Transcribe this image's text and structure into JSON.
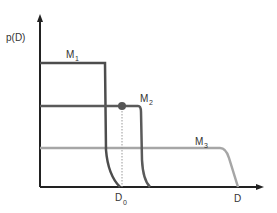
{
  "diagram": {
    "y_axis_label": "p(D)",
    "x_axis_label": "D",
    "x_marker_label": "D",
    "x_marker_sub": "0",
    "curves": [
      {
        "name": "M",
        "sub": "1",
        "color": "#4d4d4d",
        "plateau_y": 63,
        "plateau_end_x": 105,
        "end_x": 120
      },
      {
        "name": "M",
        "sub": "2",
        "color": "#5a5a5a",
        "plateau_y": 106,
        "plateau_end_x": 140,
        "end_x": 150
      },
      {
        "name": "M",
        "sub": "3",
        "color": "#a6a6a6",
        "plateau_y": 148,
        "plateau_end_x": 222,
        "end_x": 238
      }
    ],
    "marker_point": {
      "x": 122,
      "y": 106,
      "color": "#555555"
    },
    "colors": {
      "axis": "#222222",
      "dotted": "#999999"
    }
  }
}
